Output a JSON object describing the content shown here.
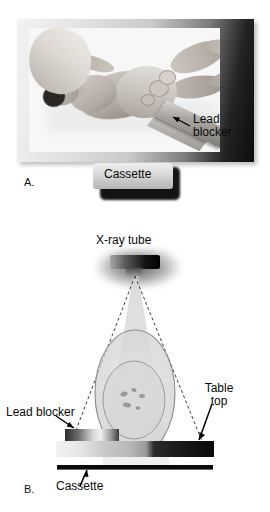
{
  "figure": {
    "background_color": "#ffffff"
  },
  "panels": [
    {
      "id": "A",
      "letter": "A.",
      "type": "photograph",
      "description": "Supine patient photograph with pelvis and lead blocker board",
      "labels": [
        {
          "name": "lead-blocker",
          "line1": "Lead",
          "line2": "blocker",
          "arrow": "up-left"
        },
        {
          "name": "cassette",
          "text": "Cassette"
        }
      ]
    },
    {
      "id": "B",
      "letter": "B.",
      "type": "diagram",
      "description": "Cross-sectional schematic of x-ray beam, patient, table top, lead blocker and cassette",
      "labels": [
        {
          "name": "xray-tube",
          "text": "X-ray tube"
        },
        {
          "name": "lead-blocker",
          "text": "Lead blocker",
          "arrow": "down-right"
        },
        {
          "name": "table-top",
          "line1": "Table",
          "line2": "top",
          "arrow": "down-left"
        },
        {
          "name": "cassette",
          "text": "Cassette",
          "arrow": "up-right"
        }
      ]
    }
  ],
  "panel_a": {
    "letter": "A.",
    "lead_blocker_line1": "Lead",
    "lead_blocker_line2": "blocker",
    "cassette_label": "Cassette"
  },
  "panel_b": {
    "letter": "B.",
    "xray_tube_label": "X-ray tube",
    "lead_blocker_label": "Lead blocker",
    "table_top_line1": "Table",
    "table_top_line2": "top",
    "cassette_label": "Cassette"
  },
  "colors": {
    "text": "#0a0a0a",
    "table_top_light": "#f2f2f2",
    "table_top_dark": "#090909",
    "cassette_line": "#0a0a0a",
    "beam_fill": "#d8d8d8",
    "body_outline": "#8f8f8f",
    "tube_body": "#151515"
  }
}
